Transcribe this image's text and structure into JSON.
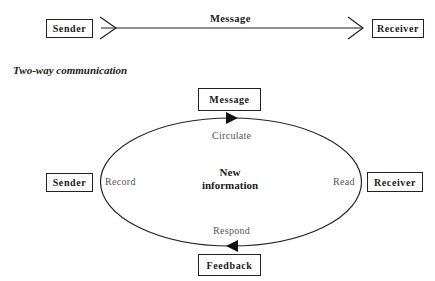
{
  "one_way": {
    "sender_label": "Sender",
    "message_label": "Message",
    "receiver_label": "Receiver"
  },
  "two_way": {
    "title": "Two-way communication",
    "top_box": "Message",
    "bottom_box": "Feedback",
    "left_box": "Sender",
    "right_box": "Receiver",
    "center_text_line1": "New",
    "center_text_line2": "information",
    "arc_labels": {
      "top": "Circulate",
      "right": "Read",
      "bottom": "Respond",
      "left": "Record"
    }
  },
  "colors": {
    "stroke": "#222222",
    "text": "#1a1a1a",
    "muted_text": "#555555",
    "background": "#ffffff"
  }
}
